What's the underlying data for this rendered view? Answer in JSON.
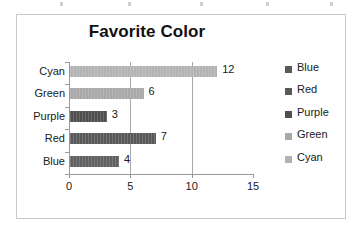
{
  "chart_data": {
    "type": "bar",
    "orientation": "horizontal",
    "title": "Favorite Color",
    "xlabel": "",
    "ylabel": "",
    "categories": [
      "Cyan",
      "Green",
      "Purple",
      "Red",
      "Blue"
    ],
    "values": [
      12,
      6,
      3,
      7,
      4
    ],
    "data_labels": [
      "12",
      "6",
      "3",
      "7",
      "4"
    ],
    "xlim": [
      0,
      15
    ],
    "xticks": [
      0,
      5,
      10,
      15
    ],
    "xtick_labels": [
      "0",
      "5",
      "10",
      "15"
    ],
    "grid": true,
    "gridlines_at": [
      5,
      10
    ],
    "legend_position": "right",
    "legend": [
      {
        "label": "Blue",
        "color": "#595959"
      },
      {
        "label": "Red",
        "color": "#595959"
      },
      {
        "label": "Purple",
        "color": "#4f4f4f"
      },
      {
        "label": "Green",
        "color": "#a8a8a8"
      },
      {
        "label": "Cyan",
        "color": "#b3b3b3"
      }
    ],
    "bar_colors": [
      "#b3b3b3",
      "#a8a8a8",
      "#4f4f4f",
      "#595959",
      "#606060"
    ]
  },
  "frame": {
    "border_color": "#c9c9c9",
    "axis_color": "#9a9a9a",
    "background": "#ffffff"
  }
}
